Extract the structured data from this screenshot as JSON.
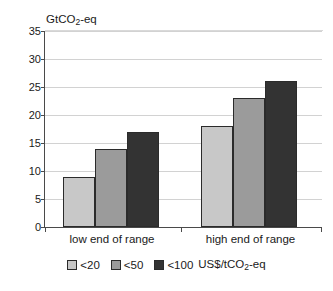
{
  "chart_data": {
    "type": "bar",
    "title": "",
    "ylabel": "GtCO2-eq",
    "ylabel_parts": {
      "pre": "GtCO",
      "sub": "2",
      "post": "-eq"
    },
    "xlabel": "",
    "categories": [
      "low end of range",
      "high end of range"
    ],
    "series": [
      {
        "name": "<20",
        "values": [
          9,
          18
        ],
        "color": "#c8c8c8"
      },
      {
        "name": "<50",
        "values": [
          14,
          23
        ],
        "color": "#9b9b9b"
      },
      {
        "name": "<100",
        "values": [
          17,
          26
        ],
        "color": "#333333"
      }
    ],
    "ylim": [
      0,
      35
    ],
    "ytick_step": 5,
    "yticks": [
      "35",
      "30",
      "25",
      "20",
      "15",
      "10",
      "5",
      "0"
    ],
    "grid": true,
    "grid_axis": "y",
    "legend_position": "bottom",
    "legend_units": "US$/tCO2-eq",
    "legend_units_parts": {
      "pre": "US$/tCO",
      "sub": "2",
      "post": "-eq"
    }
  }
}
